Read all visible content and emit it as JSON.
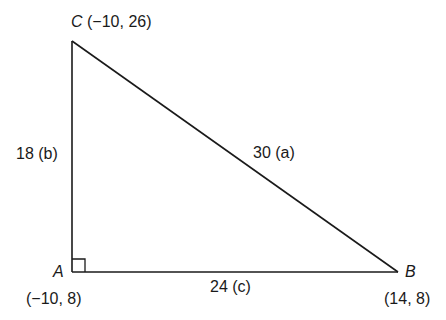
{
  "figure": {
    "type": "right-triangle",
    "colors": {
      "stroke": "#1a1a1a",
      "background": "#ffffff"
    },
    "vertices": [
      {
        "name": "C",
        "coords": "(−10, 26)",
        "x": -10,
        "y": 26
      },
      {
        "name": "A",
        "coords": "(−10, 8)",
        "x": -10,
        "y": 8,
        "right_angle": true
      },
      {
        "name": "B",
        "coords": "(14, 8)",
        "x": 14,
        "y": 8
      }
    ],
    "sides": [
      {
        "label": "18 (b)",
        "between": "A-C",
        "length": 18,
        "letter": "b"
      },
      {
        "label": "24 (c)",
        "between": "A-B",
        "length": 24,
        "letter": "c"
      },
      {
        "label": "30 (a)",
        "between": "C-B",
        "length": 30,
        "letter": "a"
      }
    ]
  }
}
